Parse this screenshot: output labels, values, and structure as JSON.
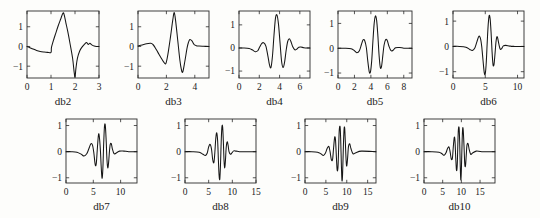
{
  "figure": {
    "title": "",
    "background_color": "#fdfdfb",
    "line_color": "#161616",
    "axis_color": "#2b2b2b",
    "rows": 2,
    "columns_row1": 5,
    "columns_row2": 4
  },
  "chart_data": [
    {
      "type": "line",
      "title": "db2",
      "xlabel": "",
      "ylabel": "",
      "xlim": [
        0,
        3
      ],
      "ylim": [
        -1.6,
        1.8
      ],
      "xticks": [
        0,
        1,
        2,
        3
      ],
      "xticklabels": [
        "0",
        "1",
        "2",
        "3"
      ],
      "yticks": [
        -1,
        0,
        1
      ],
      "yticklabels": [
        "-1",
        "0",
        "1"
      ],
      "grid": false,
      "legend": "none",
      "series": [
        {
          "name": "db2 wavelet",
          "x": [
            0.0,
            0.12,
            0.25,
            0.4,
            0.55,
            0.7,
            0.85,
            1.0,
            1.02,
            1.12,
            1.2,
            1.3,
            1.4,
            1.5,
            1.55,
            1.62,
            1.7,
            1.8,
            1.9,
            1.96,
            2.0,
            2.04,
            2.1,
            2.2,
            2.3,
            2.4,
            2.48,
            2.55,
            2.62,
            2.7,
            2.8,
            2.9,
            3.0
          ],
          "y": [
            0.0,
            -0.06,
            -0.13,
            -0.2,
            -0.25,
            -0.28,
            -0.3,
            -0.3,
            -0.05,
            0.38,
            0.68,
            1.05,
            1.38,
            1.7,
            1.6,
            1.2,
            0.75,
            0.1,
            -0.6,
            -1.25,
            -1.55,
            -1.1,
            -0.6,
            -0.22,
            -0.02,
            0.12,
            0.2,
            0.1,
            0.16,
            0.08,
            0.02,
            0.0,
            0.0
          ]
        }
      ]
    },
    {
      "type": "line",
      "title": "db3",
      "xlabel": "",
      "ylabel": "",
      "xlim": [
        0,
        5
      ],
      "ylim": [
        -1.6,
        1.8
      ],
      "xticks": [
        0,
        2,
        4
      ],
      "xticklabels": [
        "0",
        "2",
        "4"
      ],
      "yticks": [
        -1,
        0,
        1
      ],
      "yticklabels": [
        "-1",
        "0",
        "1"
      ],
      "grid": false,
      "legend": "none",
      "series": [
        {
          "name": "db3 wavelet",
          "x": [
            0.0,
            0.3,
            0.6,
            0.9,
            1.05,
            1.2,
            1.4,
            1.6,
            1.8,
            1.95,
            2.05,
            2.15,
            2.3,
            2.45,
            2.55,
            2.65,
            2.8,
            2.95,
            3.05,
            3.15,
            3.3,
            3.45,
            3.55,
            3.65,
            3.8,
            3.95,
            4.1,
            4.3,
            4.6,
            5.0
          ],
          "y": [
            0.02,
            0.08,
            0.14,
            0.16,
            0.1,
            -0.05,
            -0.3,
            -0.55,
            -0.78,
            -0.88,
            -0.62,
            -0.2,
            0.55,
            1.35,
            1.72,
            1.3,
            0.3,
            -0.7,
            -1.15,
            -1.3,
            -0.75,
            -0.1,
            0.2,
            0.35,
            0.28,
            0.1,
            0.04,
            0.02,
            0.01,
            0.0
          ]
        }
      ]
    },
    {
      "type": "line",
      "title": "db4",
      "xlabel": "",
      "ylabel": "",
      "xlim": [
        0,
        7
      ],
      "ylim": [
        -1.3,
        1.6
      ],
      "xticks": [
        0,
        2,
        4,
        6
      ],
      "xticklabels": [
        "0",
        "2",
        "4",
        "6"
      ],
      "yticks": [
        -1,
        0,
        1
      ],
      "yticklabels": [
        "-1",
        "0",
        "1"
      ],
      "grid": false,
      "legend": "none",
      "series": [
        {
          "name": "db4 wavelet",
          "x": [
            0.0,
            0.5,
            1.0,
            1.3,
            1.6,
            1.85,
            2.05,
            2.25,
            2.45,
            2.65,
            2.85,
            3.0,
            3.15,
            3.3,
            3.45,
            3.6,
            3.75,
            3.9,
            4.05,
            4.2,
            4.35,
            4.5,
            4.65,
            4.8,
            4.95,
            5.1,
            5.3,
            5.5,
            5.7,
            5.9,
            6.1,
            6.4,
            6.7,
            7.0
          ],
          "y": [
            0.0,
            0.0,
            -0.02,
            -0.08,
            -0.16,
            -0.12,
            0.05,
            0.2,
            0.22,
            0.08,
            -0.35,
            -0.72,
            -0.85,
            -0.35,
            0.55,
            1.3,
            1.42,
            1.0,
            0.2,
            -0.58,
            -0.85,
            -0.6,
            -0.1,
            0.28,
            0.4,
            0.3,
            0.05,
            -0.08,
            -0.05,
            0.03,
            0.04,
            0.01,
            0.0,
            0.0
          ]
        }
      ]
    },
    {
      "type": "line",
      "title": "db5",
      "xlabel": "",
      "ylabel": "",
      "xlim": [
        0,
        9
      ],
      "ylim": [
        -1.2,
        1.5
      ],
      "xticks": [
        0,
        2,
        4,
        6,
        8
      ],
      "xticklabels": [
        "0",
        "2",
        "4",
        "6",
        "8"
      ],
      "yticks": [
        -1,
        0,
        1
      ],
      "yticklabels": [
        "-1",
        "0",
        "1"
      ],
      "grid": false,
      "legend": "none",
      "series": [
        {
          "name": "db5 wavelet",
          "x": [
            0.0,
            0.8,
            1.6,
            2.0,
            2.3,
            2.6,
            2.85,
            3.05,
            3.25,
            3.45,
            3.6,
            3.8,
            3.95,
            4.1,
            4.25,
            4.4,
            4.55,
            4.7,
            4.85,
            5.0,
            5.15,
            5.3,
            5.45,
            5.6,
            5.8,
            6.0,
            6.2,
            6.45,
            6.7,
            7.0,
            7.5,
            8.0,
            8.5,
            9.0
          ],
          "y": [
            0.0,
            0.0,
            -0.02,
            -0.1,
            -0.18,
            -0.1,
            0.15,
            0.34,
            0.3,
            0.02,
            -0.45,
            -0.95,
            -0.95,
            -0.5,
            0.3,
            1.0,
            1.3,
            1.12,
            0.5,
            -0.3,
            -0.78,
            -0.72,
            -0.3,
            0.12,
            0.35,
            0.3,
            0.08,
            -0.1,
            -0.08,
            0.02,
            0.03,
            0.0,
            0.0,
            0.0
          ]
        }
      ]
    },
    {
      "type": "line",
      "title": "db6",
      "xlabel": "",
      "ylabel": "",
      "xlim": [
        0,
        11
      ],
      "ylim": [
        -1.25,
        1.4
      ],
      "xticks": [
        0,
        5,
        10
      ],
      "xticklabels": [
        "0",
        "5",
        "10"
      ],
      "yticks": [
        -1,
        0,
        1
      ],
      "yticklabels": [
        "-1",
        "0",
        "1"
      ],
      "grid": false,
      "legend": "none",
      "series": [
        {
          "name": "db6 wavelet",
          "x": [
            0.0,
            1.0,
            2.0,
            2.6,
            3.0,
            3.4,
            3.7,
            4.0,
            4.25,
            4.45,
            4.65,
            4.85,
            5.0,
            5.15,
            5.3,
            5.45,
            5.6,
            5.75,
            5.9,
            6.05,
            6.2,
            6.35,
            6.5,
            6.65,
            6.8,
            6.95,
            7.1,
            7.3,
            7.5,
            7.8,
            8.2,
            8.8,
            9.5,
            10.3,
            11.0
          ],
          "y": [
            0.0,
            0.0,
            -0.03,
            -0.12,
            -0.16,
            -0.05,
            0.18,
            0.4,
            0.32,
            0.0,
            -0.55,
            -1.05,
            -1.08,
            -0.65,
            0.15,
            0.85,
            1.22,
            1.1,
            0.55,
            -0.2,
            -0.72,
            -0.72,
            -0.32,
            0.15,
            0.38,
            0.3,
            0.1,
            -0.1,
            -0.1,
            0.02,
            0.04,
            0.01,
            0.0,
            0.0,
            0.0
          ]
        }
      ]
    },
    {
      "type": "line",
      "title": "db7",
      "xlabel": "",
      "ylabel": "",
      "xlim": [
        0,
        13
      ],
      "ylim": [
        -1.2,
        1.25
      ],
      "xticks": [
        0,
        5,
        10
      ],
      "xticklabels": [
        "0",
        "5",
        "10"
      ],
      "yticks": [
        -1,
        0,
        1
      ],
      "yticklabels": [
        "-1",
        "0",
        "1"
      ],
      "grid": false,
      "legend": "none",
      "series": [
        {
          "name": "db7 wavelet",
          "x": [
            0.0,
            1.0,
            2.0,
            2.8,
            3.3,
            3.8,
            4.2,
            4.55,
            4.85,
            5.1,
            5.35,
            5.55,
            5.75,
            5.95,
            6.1,
            6.3,
            6.45,
            6.6,
            6.75,
            6.9,
            7.05,
            7.2,
            7.35,
            7.5,
            7.65,
            7.8,
            7.95,
            8.1,
            8.3,
            8.5,
            8.8,
            9.2,
            9.8,
            10.6,
            11.5,
            13.0
          ],
          "y": [
            0.0,
            0.0,
            -0.02,
            -0.1,
            -0.17,
            -0.08,
            0.12,
            0.3,
            0.25,
            -0.05,
            -0.5,
            -0.45,
            0.15,
            0.65,
            0.58,
            0.05,
            -0.6,
            -1.02,
            -0.65,
            0.3,
            0.98,
            1.0,
            0.45,
            -0.3,
            -0.62,
            -0.42,
            0.0,
            0.28,
            0.3,
            0.1,
            -0.08,
            -0.05,
            0.02,
            0.02,
            0.0,
            0.0
          ]
        }
      ]
    },
    {
      "type": "line",
      "title": "db8",
      "xlabel": "",
      "ylabel": "",
      "xlim": [
        0,
        15
      ],
      "ylim": [
        -1.2,
        1.25
      ],
      "xticks": [
        0,
        5,
        10,
        15
      ],
      "xticklabels": [
        "0",
        "5",
        "10",
        "15"
      ],
      "yticks": [
        -1,
        0,
        1
      ],
      "yticklabels": [
        "-1",
        "0",
        "1"
      ],
      "grid": false,
      "legend": "none",
      "series": [
        {
          "name": "db8 wavelet",
          "x": [
            0.0,
            1.5,
            3.0,
            3.8,
            4.3,
            4.7,
            5.0,
            5.3,
            5.6,
            5.85,
            6.1,
            6.3,
            6.5,
            6.7,
            6.9,
            7.05,
            7.2,
            7.35,
            7.5,
            7.65,
            7.8,
            7.95,
            8.1,
            8.25,
            8.4,
            8.55,
            8.7,
            8.9,
            9.1,
            9.3,
            9.6,
            9.9,
            10.3,
            10.8,
            11.5,
            12.5,
            15.0
          ],
          "y": [
            0.0,
            0.0,
            -0.02,
            -0.1,
            -0.15,
            -0.05,
            0.18,
            0.28,
            0.1,
            -0.3,
            -0.42,
            -0.05,
            0.5,
            0.72,
            0.4,
            -0.3,
            -0.9,
            -1.05,
            -0.5,
            0.4,
            0.95,
            0.95,
            0.4,
            -0.35,
            -0.62,
            -0.32,
            0.15,
            0.38,
            0.25,
            0.0,
            -0.1,
            -0.05,
            0.03,
            0.02,
            0.0,
            0.0,
            0.0
          ]
        }
      ]
    },
    {
      "type": "line",
      "title": "db9",
      "xlabel": "",
      "ylabel": "",
      "xlim": [
        0,
        17
      ],
      "ylim": [
        -1.2,
        1.25
      ],
      "xticks": [
        0,
        5,
        10,
        15
      ],
      "xticklabels": [
        "0",
        "5",
        "10",
        "15"
      ],
      "yticks": [
        -1,
        0,
        1
      ],
      "yticklabels": [
        "-1",
        "0",
        "1"
      ],
      "grid": false,
      "legend": "none",
      "series": [
        {
          "name": "db9 wavelet",
          "x": [
            0.0,
            1.5,
            3.0,
            3.8,
            4.4,
            4.9,
            5.3,
            5.7,
            6.0,
            6.3,
            6.6,
            6.85,
            7.1,
            7.3,
            7.5,
            7.7,
            7.9,
            8.05,
            8.2,
            8.4,
            8.55,
            8.7,
            8.85,
            9.0,
            9.2,
            9.35,
            9.5,
            9.65,
            9.85,
            10.0,
            10.2,
            10.4,
            10.7,
            11.0,
            11.5,
            12.2,
            13.5,
            17.0
          ],
          "y": [
            0.0,
            0.0,
            -0.02,
            -0.08,
            -0.15,
            -0.05,
            0.12,
            0.2,
            0.0,
            -0.3,
            -0.3,
            0.15,
            0.55,
            0.45,
            -0.15,
            -0.7,
            -0.6,
            0.1,
            0.82,
            0.95,
            0.45,
            -0.45,
            -1.1,
            -0.85,
            0.25,
            0.85,
            0.9,
            0.4,
            -0.35,
            -0.55,
            -0.25,
            0.18,
            0.3,
            0.12,
            -0.08,
            -0.04,
            0.02,
            0.0
          ]
        }
      ]
    },
    {
      "type": "line",
      "title": "db10",
      "xlabel": "",
      "ylabel": "",
      "xlim": [
        0,
        19
      ],
      "ylim": [
        -1.2,
        1.25
      ],
      "xticks": [
        0,
        5,
        10,
        15
      ],
      "xticklabels": [
        "0",
        "5",
        "10",
        "15"
      ],
      "yticks": [
        -1,
        0,
        1
      ],
      "yticklabels": [
        "-1",
        "0",
        "1"
      ],
      "grid": false,
      "legend": "none",
      "series": [
        {
          "name": "db10 wavelet",
          "x": [
            0.0,
            2.0,
            4.0,
            4.8,
            5.4,
            5.9,
            6.3,
            6.7,
            7.0,
            7.3,
            7.6,
            7.85,
            8.1,
            8.3,
            8.5,
            8.7,
            8.9,
            9.05,
            9.2,
            9.4,
            9.55,
            9.7,
            9.85,
            10.0,
            10.2,
            10.35,
            10.5,
            10.7,
            10.9,
            11.1,
            11.3,
            11.5,
            11.8,
            12.1,
            12.5,
            13.0,
            14.0,
            15.5,
            19.0
          ],
          "y": [
            0.0,
            0.0,
            -0.02,
            -0.08,
            -0.14,
            -0.04,
            0.12,
            0.18,
            -0.02,
            -0.28,
            -0.25,
            0.2,
            0.55,
            0.4,
            -0.25,
            -0.72,
            -0.5,
            0.25,
            0.85,
            0.9,
            0.35,
            -0.55,
            -1.08,
            -0.7,
            0.4,
            0.88,
            0.82,
            0.25,
            -0.45,
            -0.55,
            -0.15,
            0.25,
            0.3,
            0.08,
            -0.1,
            -0.05,
            0.02,
            0.0,
            0.0
          ]
        }
      ]
    }
  ]
}
